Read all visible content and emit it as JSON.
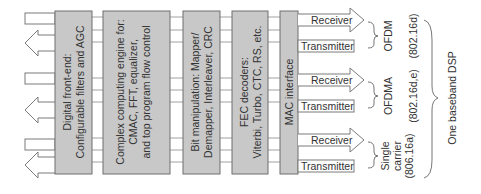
{
  "diagram": {
    "blocks": [
      {
        "id": "front-end",
        "lines": [
          "Digital front-end:",
          "Configurable filters and AGC"
        ]
      },
      {
        "id": "complex-engine",
        "lines": [
          "Complex computing engine for:",
          "CMAC, FFT, equalizer,",
          "and top program flow control"
        ]
      },
      {
        "id": "bit-manip",
        "lines": [
          "Bit manipulation: Mapper/",
          "Demapper, Interleaver, CRC"
        ]
      },
      {
        "id": "fec",
        "lines": [
          "FEC decoders:",
          "Viterbi, Turbo, CTC, RS, etc."
        ]
      },
      {
        "id": "mac",
        "lines": [
          "MAC interface"
        ]
      }
    ],
    "io_groups": [
      {
        "receiver": "Receiver",
        "transmitter": "Transmitter",
        "mode": [
          "OFDM"
        ],
        "standard": "(802.16d)"
      },
      {
        "receiver": "Receiver",
        "transmitter": "Transmitter",
        "mode": [
          "OFDMA"
        ],
        "standard": "(802.16d,e)"
      },
      {
        "receiver": "Receiver",
        "transmitter": "Transmitter",
        "mode": [
          "Single",
          "carrier"
        ],
        "standard": "(806.16a)"
      }
    ],
    "overall_label": "One baseband DSP",
    "colors": {
      "block_fill": "#c8c8c8",
      "block_stroke": "#6e6e6e",
      "line": "#7a7a7a",
      "text": "#333333"
    }
  }
}
